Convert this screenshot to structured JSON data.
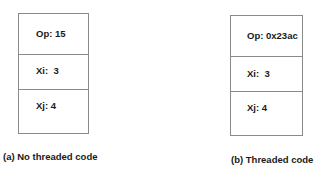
{
  "diagrams": [
    {
      "caption": "(a) No threaded code",
      "fields": [
        {
          "label": "Op: 15"
        },
        {
          "label": "Xi:  3"
        },
        {
          "label": "Xj: 4"
        }
      ]
    },
    {
      "caption": "(b) Threaded code",
      "fields": [
        {
          "label": "Op: 0x23ac"
        },
        {
          "label": "Xi:  3"
        },
        {
          "label": "Xj: 4"
        }
      ]
    }
  ]
}
